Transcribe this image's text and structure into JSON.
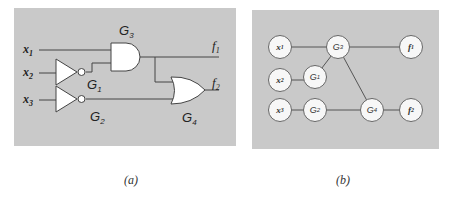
{
  "figure_a": {
    "caption": "(a)",
    "inputs": [
      {
        "name": "x",
        "sub": "1"
      },
      {
        "name": "x",
        "sub": "2"
      },
      {
        "name": "x",
        "sub": "3"
      }
    ],
    "gates": [
      {
        "id": "G1",
        "name": "G",
        "sub": "1",
        "type": "NOT",
        "input": "x2"
      },
      {
        "id": "G2",
        "name": "G",
        "sub": "2",
        "type": "NOT",
        "input": "x3"
      },
      {
        "id": "G3",
        "name": "G",
        "sub": "3",
        "type": "AND",
        "inputs": [
          "x1",
          "G1"
        ]
      },
      {
        "id": "G4",
        "name": "G",
        "sub": "4",
        "type": "OR",
        "inputs": [
          "G3",
          "G2"
        ]
      }
    ],
    "outputs": [
      {
        "name": "f",
        "sub": "1",
        "from": "G3"
      },
      {
        "name": "f",
        "sub": "2",
        "from": "G4"
      }
    ]
  },
  "figure_b": {
    "caption": "(b)",
    "nodes": [
      {
        "id": "x1",
        "name": "x",
        "sub": "1"
      },
      {
        "id": "x2",
        "name": "x",
        "sub": "2"
      },
      {
        "id": "x3",
        "name": "x",
        "sub": "3"
      },
      {
        "id": "G1",
        "name": "G",
        "sub": "1"
      },
      {
        "id": "G2",
        "name": "G",
        "sub": "2"
      },
      {
        "id": "G3",
        "name": "G",
        "sub": "3"
      },
      {
        "id": "G4",
        "name": "G",
        "sub": "4"
      },
      {
        "id": "f1",
        "name": "f",
        "sub": "1"
      },
      {
        "id": "f2",
        "name": "f",
        "sub": "2"
      }
    ],
    "edges": [
      [
        "x1",
        "G3"
      ],
      [
        "x2",
        "G1"
      ],
      [
        "G1",
        "G3"
      ],
      [
        "x3",
        "G2"
      ],
      [
        "G2",
        "G4"
      ],
      [
        "G3",
        "G4"
      ],
      [
        "G3",
        "f1"
      ],
      [
        "G4",
        "f2"
      ]
    ]
  }
}
